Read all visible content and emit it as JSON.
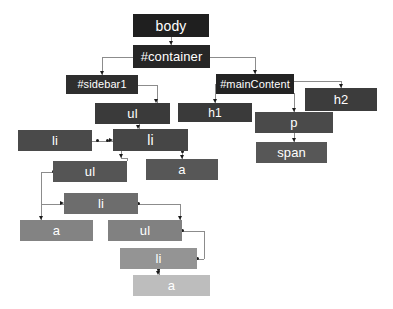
{
  "diagram": {
    "background": "#ffffff",
    "edge_color": "#8c8c8c",
    "text_color": "#ffffff",
    "nodes": [
      {
        "id": "body",
        "label": "body",
        "x": 133,
        "y": 14,
        "w": 76,
        "h": 23,
        "color": "#1f1f1f",
        "font": 14
      },
      {
        "id": "container",
        "label": "#container",
        "x": 133,
        "y": 45,
        "w": 77,
        "h": 23,
        "color": "#262626",
        "font": 13
      },
      {
        "id": "sidebar1",
        "label": "#sidebar1",
        "x": 66,
        "y": 75,
        "w": 72,
        "h": 19,
        "color": "#2e2e2e",
        "font": 11
      },
      {
        "id": "mainContent",
        "label": "#mainContent",
        "x": 216,
        "y": 74,
        "w": 78,
        "h": 20,
        "color": "#232323",
        "font": 11
      },
      {
        "id": "h2",
        "label": "h2",
        "x": 305,
        "y": 88,
        "w": 72,
        "h": 23,
        "color": "#3c3c3c",
        "font": 13
      },
      {
        "id": "ul1",
        "label": "ul",
        "x": 95,
        "y": 103,
        "w": 75,
        "h": 21,
        "color": "#3a3a3a",
        "font": 13
      },
      {
        "id": "h1",
        "label": "h1",
        "x": 178,
        "y": 103,
        "w": 74,
        "h": 19,
        "color": "#3a3a3a",
        "font": 12
      },
      {
        "id": "p",
        "label": "p",
        "x": 255,
        "y": 112,
        "w": 78,
        "h": 21,
        "color": "#4a4a4a",
        "font": 13
      },
      {
        "id": "li1",
        "label": "li",
        "x": 18,
        "y": 130,
        "w": 74,
        "h": 21,
        "color": "#4a4a4a",
        "font": 13
      },
      {
        "id": "li2",
        "label": "li",
        "x": 113,
        "y": 129,
        "w": 75,
        "h": 22,
        "color": "#464646",
        "font": 14
      },
      {
        "id": "span",
        "label": "span",
        "x": 256,
        "y": 142,
        "w": 71,
        "h": 21,
        "color": "#575757",
        "font": 13
      },
      {
        "id": "ul2",
        "label": "ul",
        "x": 53,
        "y": 161,
        "w": 74,
        "h": 21,
        "color": "#555555",
        "font": 13
      },
      {
        "id": "a1",
        "label": "a",
        "x": 146,
        "y": 159,
        "w": 72,
        "h": 21,
        "color": "#575757",
        "font": 13
      },
      {
        "id": "li3",
        "label": "li",
        "x": 64,
        "y": 193,
        "w": 74,
        "h": 21,
        "color": "#6d6d6d",
        "font": 13
      },
      {
        "id": "a2",
        "label": "a",
        "x": 20,
        "y": 220,
        "w": 73,
        "h": 21,
        "color": "#838383",
        "font": 13
      },
      {
        "id": "ul3",
        "label": "ul",
        "x": 108,
        "y": 220,
        "w": 74,
        "h": 21,
        "color": "#818181",
        "font": 13
      },
      {
        "id": "li4",
        "label": "li",
        "x": 120,
        "y": 248,
        "w": 77,
        "h": 21,
        "color": "#949494",
        "font": 13
      },
      {
        "id": "a3",
        "label": "a",
        "x": 133,
        "y": 275,
        "w": 77,
        "h": 21,
        "color": "#bdbdbd",
        "font": 13
      }
    ],
    "edges": [
      {
        "from": "body",
        "to": "container"
      },
      {
        "from": "container",
        "to": "sidebar1"
      },
      {
        "from": "container",
        "to": "mainContent"
      },
      {
        "from": "mainContent",
        "to": "h1"
      },
      {
        "from": "mainContent",
        "to": "h2"
      },
      {
        "from": "mainContent",
        "to": "p"
      },
      {
        "from": "p",
        "to": "span"
      },
      {
        "from": "sidebar1",
        "to": "ul1"
      },
      {
        "from": "ul1",
        "to": "li2"
      },
      {
        "from": "li1",
        "to": "li2"
      },
      {
        "from": "li2",
        "to": "ul2"
      },
      {
        "from": "li2",
        "to": "a1"
      },
      {
        "from": "ul2",
        "to": "li3"
      },
      {
        "from": "li3",
        "to": "a2"
      },
      {
        "from": "li3",
        "to": "ul3"
      },
      {
        "from": "ul3",
        "to": "li4"
      },
      {
        "from": "li4",
        "to": "a3"
      }
    ]
  }
}
